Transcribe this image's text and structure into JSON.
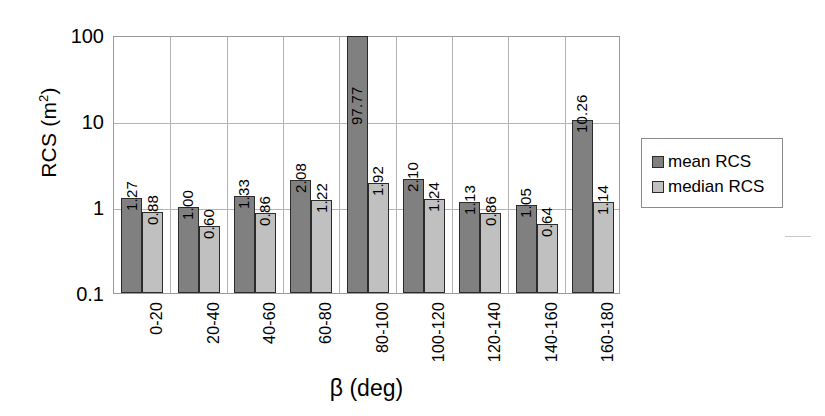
{
  "chart_data": {
    "type": "bar",
    "title": "",
    "xlabel": "β (deg)",
    "ylabel": "RCS (m²)",
    "yscale": "log",
    "ylim": [
      0.1,
      100
    ],
    "ytick_labels": [
      "100",
      "10",
      "1",
      "0.1"
    ],
    "ytick_values": [
      100,
      10,
      1,
      0.1
    ],
    "grid": true,
    "legend_position": "right",
    "categories": [
      "0-20",
      "20-40",
      "40-60",
      "60-80",
      "80-100",
      "100-120",
      "120-140",
      "140-160",
      "160-180"
    ],
    "series": [
      {
        "name": "mean RCS",
        "color": "#808080",
        "values": [
          1.27,
          1.0,
          1.33,
          2.08,
          97.77,
          2.1,
          1.13,
          1.05,
          10.26
        ],
        "labels": [
          "1.27",
          "1.00",
          "1.33",
          "2.08",
          "97.77",
          "2.10",
          "1.13",
          "1.05",
          "10.26"
        ]
      },
      {
        "name": "median RCS",
        "color": "#c0c0c0",
        "values": [
          0.88,
          0.6,
          0.86,
          1.22,
          1.92,
          1.24,
          0.86,
          0.64,
          1.14
        ],
        "labels": [
          "0.88",
          "0.60",
          "0.86",
          "1.22",
          "1.92",
          "1.24",
          "0.86",
          "0.64",
          "1.14"
        ]
      }
    ]
  },
  "axes": {
    "y_title_text": "RCS (m",
    "y_title_sup": "2",
    "y_title_close": ")",
    "x_title": "β (deg)"
  },
  "legend": {
    "items": [
      {
        "label": "mean RCS",
        "color": "#808080"
      },
      {
        "label": "median RCS",
        "color": "#c0c0c0"
      }
    ]
  }
}
